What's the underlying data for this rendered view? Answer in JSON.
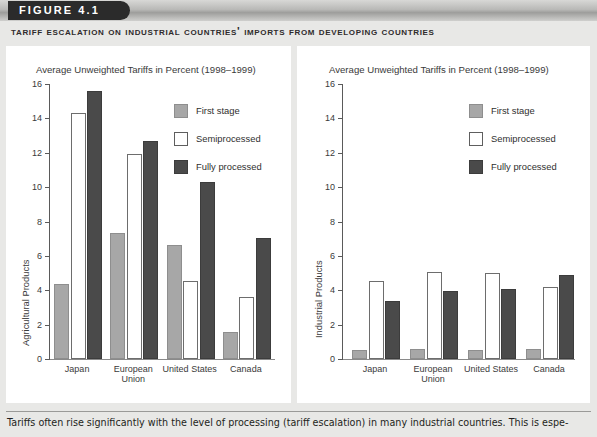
{
  "header": {
    "figure_label": "FIGURE 4.1",
    "subtitle": "Tariff Escalation on Industrial Countries' Imports from Developing Countries"
  },
  "legend": {
    "items": [
      {
        "label": "First stage",
        "color": "#a7a7a7"
      },
      {
        "label": "Semiprocessed",
        "color": "#ffffff"
      },
      {
        "label": "Fully processed",
        "color": "#4a4a4a"
      }
    ]
  },
  "caption": {
    "text": "Tariffs often rise significantly with the level of processing (tariff escalation) in many industrial countries. This is espe-"
  },
  "chart_data": [
    {
      "type": "bar",
      "panel": "left",
      "title": "Average Unweighted Tariffs in Percent (1998–1999)",
      "xlabel": "",
      "ylabel": "Agricultural Products",
      "ylim": [
        0,
        16
      ],
      "yticks": [
        0,
        2,
        4,
        6,
        8,
        10,
        12,
        14,
        16
      ],
      "grid": false,
      "legend_position": "upper-right-inside",
      "categories": [
        "Japan",
        "European Union",
        "United States",
        "Canada"
      ],
      "series": [
        {
          "name": "First stage",
          "values": [
            4.35,
            7.35,
            6.65,
            1.55
          ]
        },
        {
          "name": "Semiprocessed",
          "values": [
            14.3,
            11.95,
            4.55,
            3.6
          ]
        },
        {
          "name": "Fully processed",
          "values": [
            15.6,
            12.7,
            10.3,
            7.05
          ]
        }
      ]
    },
    {
      "type": "bar",
      "panel": "right",
      "title": "Average Unweighted Tariffs in Percent (1998–1999)",
      "xlabel": "",
      "ylabel": "Industrial Products",
      "ylim": [
        0,
        16
      ],
      "yticks": [
        0,
        2,
        4,
        6,
        8,
        10,
        12,
        14,
        16
      ],
      "grid": false,
      "legend_position": "upper-right-inside",
      "categories": [
        "Japan",
        "European Union",
        "United States",
        "Canada"
      ],
      "series": [
        {
          "name": "First stage",
          "values": [
            0.55,
            0.6,
            0.55,
            0.6
          ]
        },
        {
          "name": "Semiprocessed",
          "values": [
            4.55,
            5.05,
            5.0,
            4.2
          ]
        },
        {
          "name": "Fully processed",
          "values": [
            3.4,
            3.95,
            4.1,
            4.9
          ]
        }
      ]
    }
  ]
}
